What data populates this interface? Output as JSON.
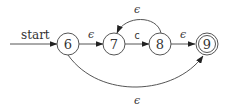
{
  "diagram": {
    "type": "nfa",
    "start_label": "start",
    "states": [
      {
        "id": "6",
        "label": "6",
        "accepting": false,
        "start": true
      },
      {
        "id": "7",
        "label": "7",
        "accepting": false,
        "start": false
      },
      {
        "id": "8",
        "label": "8",
        "accepting": false,
        "start": false
      },
      {
        "id": "9",
        "label": "9",
        "accepting": true,
        "start": false
      }
    ],
    "transitions": [
      {
        "from": "6",
        "to": "7",
        "label": "ϵ"
      },
      {
        "from": "7",
        "to": "8",
        "label": "c"
      },
      {
        "from": "8",
        "to": "9",
        "label": "ϵ"
      },
      {
        "from": "8",
        "to": "7",
        "label": "ϵ"
      },
      {
        "from": "6",
        "to": "9",
        "label": "ϵ"
      }
    ]
  }
}
